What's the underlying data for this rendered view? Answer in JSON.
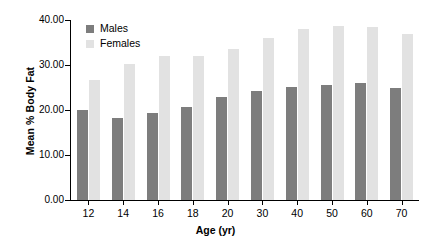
{
  "chart_data": {
    "type": "bar",
    "title": "",
    "xlabel": "Age (yr)",
    "ylabel": "Mean % Body Fat",
    "categories": [
      "12",
      "14",
      "16",
      "18",
      "20",
      "30",
      "40",
      "50",
      "60",
      "70"
    ],
    "series": [
      {
        "name": "Males",
        "color": "#7d7d7d",
        "values": [
          19.9,
          18.3,
          19.3,
          20.6,
          23.0,
          24.2,
          25.2,
          25.6,
          25.9,
          24.9
        ]
      },
      {
        "name": "Females",
        "color": "#e2e2e2",
        "values": [
          26.7,
          30.2,
          32.0,
          32.1,
          33.6,
          35.9,
          38.0,
          38.6,
          38.5,
          37.0
        ]
      }
    ],
    "ylim": [
      0.0,
      40.0
    ],
    "yticks": [
      0.0,
      10.0,
      20.0,
      30.0,
      40.0
    ],
    "ytick_labels": [
      "0.00",
      "10.00",
      "20.00",
      "30.00",
      "40.00"
    ],
    "grid": false,
    "legend_position": "top-left"
  },
  "legend": {
    "items": [
      {
        "label": "Males"
      },
      {
        "label": "Females"
      }
    ]
  }
}
